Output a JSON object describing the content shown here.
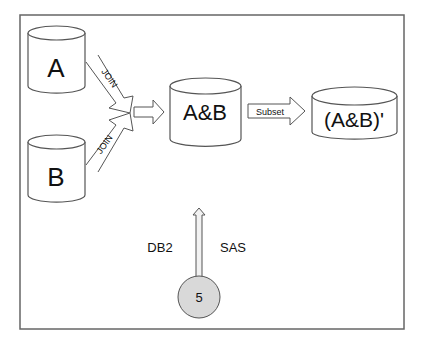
{
  "diagram": {
    "nodes": {
      "a": {
        "label": "A"
      },
      "b": {
        "label": "B"
      },
      "ab": {
        "label": "A&B"
      },
      "ab_subset": {
        "label": "(A&B)'"
      },
      "step": {
        "label": "5"
      }
    },
    "edges": {
      "join_a": {
        "label": "JOIN"
      },
      "join_b": {
        "label": "JOIN"
      },
      "subset": {
        "label": "Subset"
      }
    },
    "annotations": {
      "left": "DB2",
      "right": "SAS"
    },
    "colors": {
      "stroke": "#555555",
      "circle_fill": "#d9d9d9",
      "frame": "#666666"
    }
  }
}
